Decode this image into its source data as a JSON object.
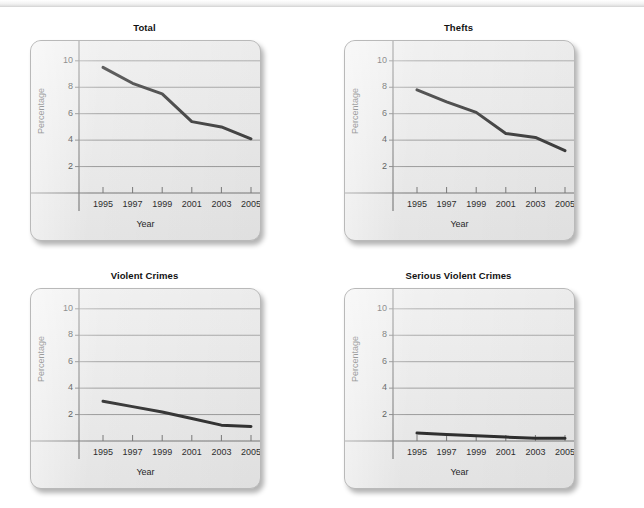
{
  "figure": {
    "panel_titles": [
      "Total",
      "Thefts",
      "Violent Crimes",
      "Serious Violent Crimes"
    ]
  },
  "chart_data": [
    {
      "type": "line",
      "title": "Total",
      "xlabel": "Year",
      "ylabel": "Percentage",
      "categories": [
        1995,
        1997,
        1999,
        2001,
        2003,
        2005
      ],
      "x_tick_labels": [
        "1995",
        "1997",
        "1999",
        "2001",
        "2003",
        "2005"
      ],
      "y_tick_labels": [
        "2",
        "4",
        "6",
        "8",
        "10"
      ],
      "y_ticks": [
        2,
        4,
        6,
        8,
        10
      ],
      "values": [
        9.5,
        8.3,
        7.5,
        5.4,
        5.0,
        4.1
      ],
      "xlim": [
        1994,
        2006
      ],
      "ylim": [
        0,
        11.5
      ],
      "grid": true,
      "legend": "none",
      "line_color": "#1a1a1a"
    },
    {
      "type": "line",
      "title": "Thefts",
      "xlabel": "Year",
      "ylabel": "Percentage",
      "categories": [
        1995,
        1997,
        1999,
        2001,
        2003,
        2005
      ],
      "x_tick_labels": [
        "1995",
        "1997",
        "1999",
        "2001",
        "2003",
        "2005"
      ],
      "y_tick_labels": [
        "2",
        "4",
        "6",
        "8",
        "10"
      ],
      "y_ticks": [
        2,
        4,
        6,
        8,
        10
      ],
      "values": [
        7.8,
        6.9,
        6.1,
        4.5,
        4.2,
        3.2
      ],
      "xlim": [
        1994,
        2006
      ],
      "ylim": [
        0,
        11.5
      ],
      "grid": true,
      "legend": "none",
      "line_color": "#1a1a1a"
    },
    {
      "type": "line",
      "title": "Violent Crimes",
      "xlabel": "Year",
      "ylabel": "Percentage",
      "categories": [
        1995,
        1997,
        1999,
        2001,
        2003,
        2005
      ],
      "x_tick_labels": [
        "1995",
        "1997",
        "1999",
        "2001",
        "2003",
        "2005"
      ],
      "y_tick_labels": [
        "2",
        "4",
        "6",
        "8",
        "10"
      ],
      "y_ticks": [
        2,
        4,
        6,
        8,
        10
      ],
      "values": [
        3.0,
        2.6,
        2.2,
        1.7,
        1.2,
        1.1
      ],
      "xlim": [
        1994,
        2006
      ],
      "ylim": [
        0,
        11.5
      ],
      "grid": true,
      "legend": "none",
      "line_color": "#1a1a1a"
    },
    {
      "type": "line",
      "title": "Serious Violent Crimes",
      "xlabel": "Year",
      "ylabel": "Percentage",
      "categories": [
        1995,
        1997,
        1999,
        2001,
        2003,
        2005
      ],
      "x_tick_labels": [
        "1995",
        "1997",
        "1999",
        "2001",
        "2003",
        "2005"
      ],
      "y_tick_labels": [
        "2",
        "4",
        "6",
        "8",
        "10"
      ],
      "y_ticks": [
        2,
        4,
        6,
        8,
        10
      ],
      "values": [
        0.6,
        0.5,
        0.4,
        0.3,
        0.2,
        0.2
      ],
      "xlim": [
        1994,
        2006
      ],
      "ylim": [
        0,
        11.5
      ],
      "grid": true,
      "legend": "none",
      "line_color": "#1a1a1a"
    }
  ]
}
